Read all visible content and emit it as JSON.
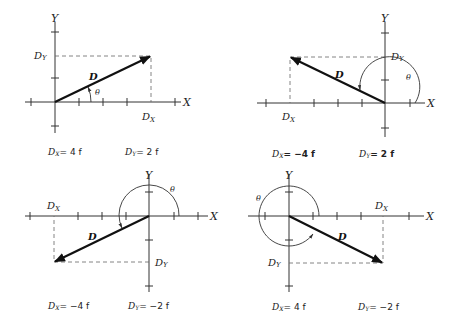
{
  "figure": {
    "unit_spacing_px": 24
  },
  "panels": [
    {
      "id": "q1",
      "origin": [
        55,
        102
      ],
      "end": [
        151,
        56
      ],
      "axis_x_label": "X",
      "axis_y_label": "Y",
      "vector_label": "D",
      "angle_label": "θ",
      "dx_axis_label": "D",
      "dx_axis_sub": "X",
      "dy_axis_label": "D",
      "dy_axis_sub": "Y",
      "eq_dx": {
        "sym": "D",
        "sub": "X",
        "value": "= 4 f"
      },
      "eq_dy": {
        "sym": "D",
        "sub": "Y",
        "value": "= 2 f"
      }
    },
    {
      "id": "q2",
      "origin": [
        385,
        103
      ],
      "end": [
        290,
        57
      ],
      "axis_x_label": "X",
      "axis_y_label": "Y",
      "vector_label": "D",
      "angle_label": "θ",
      "dx_axis_label": "D",
      "dx_axis_sub": "X",
      "dy_axis_label": "D",
      "dy_axis_sub": "Y",
      "eq_dx": {
        "sym": "D",
        "sub": "X",
        "value": "= −4 f"
      },
      "eq_dy": {
        "sym": "D",
        "sub": "Y",
        "value": "= 2 f"
      }
    },
    {
      "id": "q3",
      "origin": [
        149,
        216
      ],
      "end": [
        54,
        262
      ],
      "axis_x_label": "X",
      "axis_y_label": "Y",
      "vector_label": "D",
      "angle_label": "θ",
      "dx_axis_label": "D",
      "dx_axis_sub": "X",
      "dy_axis_label": "D",
      "dy_axis_sub": "Y",
      "eq_dx": {
        "sym": "D",
        "sub": "X",
        "value": "= −4 f"
      },
      "eq_dy": {
        "sym": "D",
        "sub": "Y",
        "value": "= −2 f"
      }
    },
    {
      "id": "q4",
      "origin": [
        289,
        216
      ],
      "end": [
        383,
        263
      ],
      "axis_x_label": "X",
      "axis_y_label": "Y",
      "vector_label": "D",
      "angle_label": "θ",
      "dx_axis_label": "D",
      "dx_axis_sub": "X",
      "dy_axis_label": "D",
      "dy_axis_sub": "Y",
      "eq_dx": {
        "sym": "D",
        "sub": "X",
        "value": "= 4 f"
      },
      "eq_dy": {
        "sym": "D",
        "sub": "Y",
        "value": "= −2 f"
      }
    }
  ]
}
